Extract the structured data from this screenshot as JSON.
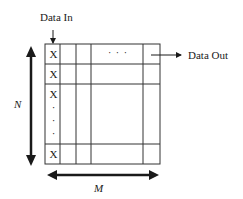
{
  "diagram": {
    "input_label": "Data In",
    "output_label": "Data Out",
    "row_dimension_label": "N",
    "column_dimension_label": "M",
    "first_column_cells": [
      "X",
      "X",
      "X",
      "X"
    ],
    "ellipsis_horizontal": "· · ·",
    "ellipsis_vertical": [
      "·",
      "·",
      "·"
    ]
  }
}
